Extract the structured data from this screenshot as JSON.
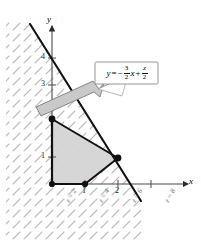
{
  "figure": {
    "axes": {
      "x_label": "x",
      "y_label": "y",
      "x_ticks": [
        {
          "value": 1,
          "label": "1",
          "px": 85
        },
        {
          "value": 2,
          "label": "2",
          "px": 118
        },
        {
          "value": 3,
          "label": "",
          "px": 151
        }
      ],
      "y_ticks": [
        {
          "value": 1,
          "label": "1",
          "px": 157
        },
        {
          "value": 3,
          "label": "3",
          "px": 85
        },
        {
          "value": 4,
          "label": "4",
          "px": 58
        }
      ],
      "origin_px": {
        "x": 52,
        "y": 184
      },
      "unit_px": {
        "x": 33,
        "y": 26
      }
    },
    "callout": {
      "equation_parts": {
        "lhs": "y",
        "equals": "=",
        "minus": "−",
        "frac1_num": "3",
        "frac1_den": "2",
        "var1": "x",
        "plus": "+",
        "frac2_num": "z",
        "frac2_den": "2"
      },
      "equation_plain": "y = -3/2 x + z/2"
    },
    "z_level_labels": [
      {
        "text": "z = 2",
        "x": 74,
        "y": 210
      },
      {
        "text": "z = 4",
        "x": 107,
        "y": 210
      },
      {
        "text": "z = 6",
        "x": 140,
        "y": 210
      },
      {
        "text": "z = 8",
        "x": 173,
        "y": 210
      }
    ],
    "feasible_region": {
      "vertices": [
        {
          "x": 0,
          "y": 0
        },
        {
          "x": 1,
          "y": 0
        },
        {
          "x": 2,
          "y": 1
        },
        {
          "x": 0,
          "y": 2.5
        }
      ],
      "vertex_markers": [
        {
          "x": 0,
          "y": 0
        },
        {
          "x": 1,
          "y": 0
        },
        {
          "x": 2,
          "y": 1
        },
        {
          "x": 0,
          "y": 2.5
        }
      ],
      "fill_color": "#d4d4d4"
    },
    "objective_line": {
      "slope": -1.5,
      "label": "y = -3/2 x + z/2",
      "endpoints_px": [
        {
          "x": 30,
          "y": 24
        },
        {
          "x": 141,
          "y": 201
        }
      ]
    },
    "direction_band": {
      "description": "gray parallelogram arrow indicating direction of increasing z",
      "fill_color": "#c9c9c9"
    },
    "hatching": {
      "description": "light gray diagonal dash shading over half-plane",
      "color": "#bfbfbf"
    },
    "colors": {
      "ink": "#1a1a1a",
      "region_fill": "#d4d4d4",
      "band_fill": "#c9c9c9",
      "hatch": "#bfbfbf",
      "callout_border": "#8a8a8a",
      "axis": "#4a4a4a"
    }
  }
}
